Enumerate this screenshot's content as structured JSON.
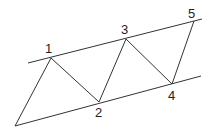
{
  "diagram": {
    "type": "zigzag-between-parallel-lines",
    "stroke_color": "#333333",
    "labels": {
      "p1": "1",
      "p2": "2",
      "p3": "3",
      "p4": "4",
      "p5": "5"
    },
    "points": {
      "start": [
        15,
        126
      ],
      "p1": [
        51,
        58
      ],
      "p2": [
        99,
        102
      ],
      "p3": [
        126,
        39
      ],
      "p4": [
        172,
        84
      ],
      "p5": [
        194,
        21
      ]
    },
    "upper_line": [
      [
        28,
        63
      ],
      [
        202,
        19
      ]
    ],
    "lower_line": [
      [
        15,
        126
      ],
      [
        201,
        76
      ]
    ]
  }
}
